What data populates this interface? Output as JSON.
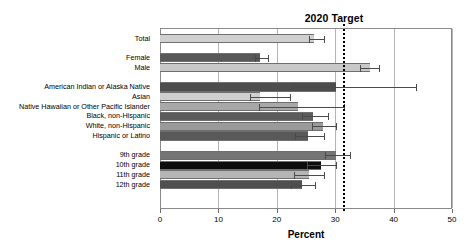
{
  "chart_data": {
    "type": "bar",
    "orientation": "horizontal",
    "title": "2020 Target",
    "xlabel": "Percent",
    "ylabel": "",
    "xlim": [
      0,
      50
    ],
    "xticks": [
      0,
      10,
      20,
      30,
      40,
      50
    ],
    "xtick_labels": [
      "0",
      "10",
      "20",
      "30",
      "40",
      "50"
    ],
    "grid": true,
    "grid_axis": "x",
    "legend": "none",
    "target_value": 31.4,
    "target_label": "2020 Target",
    "groups": [
      {
        "name": "overall",
        "categories": [
          "Total"
        ],
        "values": [
          26.4
        ],
        "errors_low": [
          25.5
        ],
        "errors_high": [
          28.0
        ],
        "colors": [
          "#d0d0d0"
        ]
      },
      {
        "name": "sex",
        "categories": [
          "Female",
          "Male"
        ],
        "values": [
          17.2,
          35.9
        ],
        "errors_low": [
          16.3,
          34.3
        ],
        "errors_high": [
          18.5,
          37.5
        ],
        "colors": [
          "#585858",
          "#c8c8c8"
        ]
      },
      {
        "name": "race-ethnicity",
        "categories": [
          "American Indian or Alaska Native",
          "Asian",
          "Native Hawaiian or Other Pacific Islander",
          "Black, non-Hispanic",
          "White, non-Hispanic",
          "Hispanic or Latino"
        ],
        "values": [
          30.1,
          17.2,
          23.6,
          26.2,
          27.9,
          25.4
        ],
        "errors_low": [
          22.9,
          15.4,
          17.0,
          24.4,
          26.0,
          23.2
        ],
        "errors_high": [
          43.8,
          22.3,
          31.5,
          28.8,
          30.1,
          28.1
        ],
        "colors": [
          "#4d4d4d",
          "#cfcfcf",
          "#a8a8a8",
          "#5c5c5c",
          "#9a9a9a",
          "#595959"
        ]
      },
      {
        "name": "grade",
        "categories": [
          "9th grade",
          "10th grade",
          "11th grade",
          "12th grade"
        ],
        "values": [
          30.2,
          27.5,
          25.5,
          24.3
        ],
        "errors_low": [
          28.2,
          25.1,
          23.0,
          22.5
        ],
        "errors_high": [
          32.6,
          30.2,
          28.0,
          26.5
        ],
        "colors": [
          "#757575",
          "#0d0d0d",
          "#b5b5b5",
          "#4f4f4f"
        ]
      }
    ]
  },
  "axis": {
    "percent_label": "Percent"
  }
}
